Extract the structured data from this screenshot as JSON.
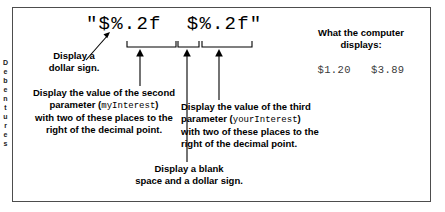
{
  "figure": {
    "format_string": "\"$%.2f  $%.2f\"",
    "margin_scrap": "D\ne\nb\ne\nn\nt\nu\nr\ne\ns"
  },
  "captions": {
    "dollar_sign": "Display a\ndollar sign.",
    "second_parameter_pre": "Display the value of the second\nparameter (",
    "second_parameter_name": "myInterest",
    "second_parameter_post": ")\nwith two of these places to the\nright of the decimal point.",
    "third_parameter_pre": "Display the value of the third\nparameter (",
    "third_parameter_name": "yourInterest",
    "third_parameter_post": ")\nwith two of these places to the\nright of the decimal point.",
    "blank_space": "Display a blank\nspace and a dollar sign."
  },
  "output": {
    "title": "What the computer\ndisplays:",
    "values": "$1.20   $3.89"
  },
  "icons": {
    "leader_arrow": "diagonal-arrow-icon",
    "bracket_1": "brace-bracket-icon",
    "bracket_2": "brace-bracket-icon",
    "bracket_3": "brace-bracket-icon",
    "callout_arrow_1": "up-arrow-icon",
    "callout_arrow_2": "up-arrow-icon",
    "callout_arrow_3": "up-arrow-icon"
  },
  "colors": {
    "ink": "#000000",
    "frame": "#4d4d4d",
    "output_text": "#3a3a3a"
  }
}
